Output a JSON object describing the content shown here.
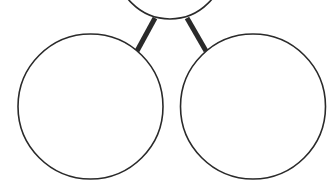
{
  "diagram": {
    "type": "tree",
    "background": "#ffffff",
    "stroke_color": "#2a2a2a",
    "nodes": [
      {
        "id": "root",
        "cx": 170,
        "cy": -35,
        "r": 54,
        "label": ""
      },
      {
        "id": "left-child",
        "cx": 90.5,
        "cy": 106.5,
        "r": 72.5,
        "label": ""
      },
      {
        "id": "right-child",
        "cx": 253,
        "cy": 106.5,
        "r": 72.5,
        "label": ""
      }
    ],
    "edges": [
      {
        "from": "root",
        "to": "left-child",
        "x1": 155,
        "y1": 18,
        "x2": 137,
        "y2": 51
      },
      {
        "from": "root",
        "to": "right-child",
        "x1": 187,
        "y1": 18,
        "x2": 206,
        "y2": 51
      }
    ]
  }
}
